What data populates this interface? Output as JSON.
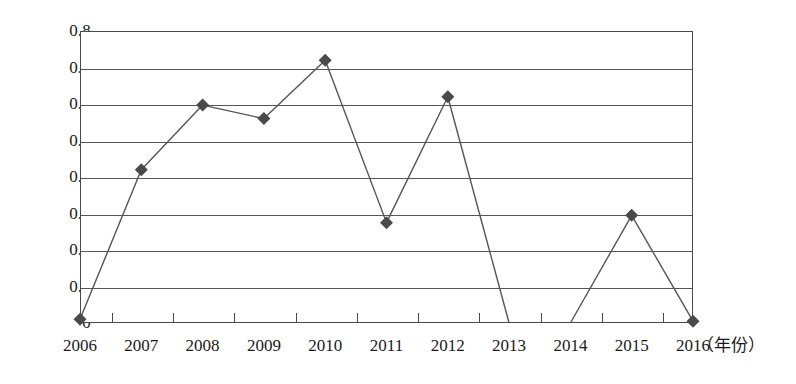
{
  "chart_data": {
    "type": "line",
    "title": "",
    "xlabel": "（年份）",
    "ylabel": "",
    "categories": [
      "2006",
      "2007",
      "2008",
      "2009",
      "2010",
      "2011",
      "2012",
      "2013",
      "2014",
      "2015",
      "2016"
    ],
    "values": [
      0.01,
      0.42,
      0.597,
      0.56,
      0.72,
      0.275,
      0.62,
      0.0,
      0.0,
      0.295,
      0.005
    ],
    "series": [
      {
        "name": "",
        "values": [
          0.01,
          0.42,
          0.597,
          0.56,
          0.72,
          0.275,
          0.62,
          0.0,
          0.0,
          0.295,
          0.005
        ]
      }
    ],
    "markers_shown_at": [
      "2006",
      "2007",
      "2008",
      "2009",
      "2010",
      "2011",
      "2012",
      "2015",
      "2016"
    ],
    "line_gap_between": [
      "2013",
      "2014"
    ],
    "ylim": [
      0,
      0.8
    ],
    "ytick_labels": [
      "0.8",
      "0.7",
      "0.6",
      "0.5",
      "0.4",
      "0.3",
      "0.2",
      "0.1",
      "0"
    ],
    "ytick_values": [
      0.8,
      0.7,
      0.6,
      0.5,
      0.4,
      0.3,
      0.2,
      0.1,
      0
    ],
    "grid": true,
    "legend": false,
    "marker_shape": "diamond",
    "colors": {
      "line": "#555555",
      "marker": "#4a4a4a",
      "grid": "#555555",
      "frame": "#4a4a4a",
      "background": "#ffffff",
      "text": "#1a1a1a"
    }
  }
}
